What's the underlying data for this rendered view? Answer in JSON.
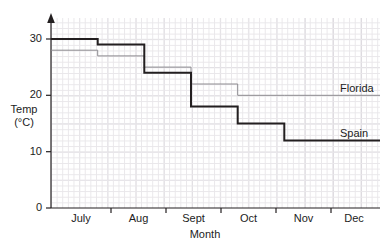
{
  "chart_data": {
    "type": "line",
    "subtype": "step",
    "title": "",
    "xlabel": "Month",
    "ylabel": "Temp (°C)",
    "ylabel_lines": [
      "Temp",
      "(°C)"
    ],
    "categories": [
      "July",
      "Aug",
      "Sept",
      "Oct",
      "Nov",
      "Dec"
    ],
    "ylim": [
      0,
      34
    ],
    "yticks": [
      0,
      10,
      20,
      30
    ],
    "ytick_labels": [
      "0",
      "10",
      "20",
      "30"
    ],
    "grid": true,
    "grid_minor_spacing": 1,
    "grid_major_spacing": 5,
    "legend": "inline-right",
    "series": [
      {
        "name": "Spain",
        "color": "#231f20",
        "width": 2,
        "values": [
          30,
          29,
          24,
          18,
          15,
          12
        ]
      },
      {
        "name": "Florida",
        "color": "#8c8a8f",
        "width": 1,
        "values": [
          28,
          27,
          25,
          22,
          20,
          20
        ]
      }
    ],
    "annotations": [
      {
        "text": "Florida",
        "series": "Florida"
      },
      {
        "text": "Spain",
        "series": "Spain"
      }
    ]
  },
  "axes": {
    "y_arrow": true,
    "x_ticks_between_categories": true
  }
}
